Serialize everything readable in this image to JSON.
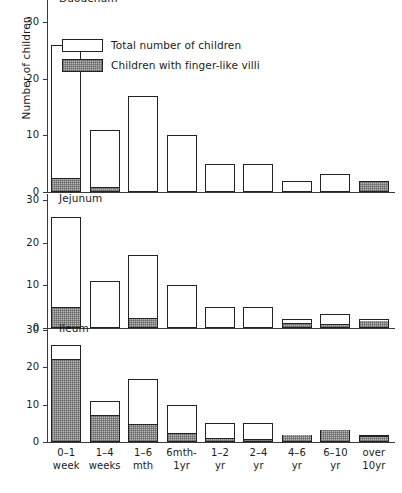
{
  "chart_data": {
    "type": "bar",
    "title": "",
    "ylabel": "Number of children",
    "xlabel": "",
    "ylim": [
      0,
      30
    ],
    "grid": false,
    "legend_position": "top-left-inside-panel-1",
    "legend": [
      {
        "key": "total",
        "label": "Total number of children",
        "style": "outline"
      },
      {
        "key": "finger_like",
        "label": "Children with finger-like villi",
        "style": "shaded"
      }
    ],
    "categories": [
      "0-1 week",
      "1-4 weeks",
      "1-6 mth",
      "6mth-1yr",
      "1-2 yr",
      "2-4 yr",
      "4-6 yr",
      "6-10 yr",
      "over 10yr"
    ],
    "category_lines": [
      [
        "0–1",
        "week"
      ],
      [
        "1–4",
        "weeks"
      ],
      [
        "1–6",
        "mth"
      ],
      [
        "6mth-",
        "1yr"
      ],
      [
        "1–2",
        "yr"
      ],
      [
        "2–4",
        "yr"
      ],
      [
        "4–6",
        "yr"
      ],
      [
        "6–10",
        "yr"
      ],
      [
        "over",
        "10yr"
      ]
    ],
    "y_ticks": [
      0,
      10,
      20,
      30
    ],
    "panels": [
      {
        "name": "Duodenum",
        "title": "Duodenum",
        "total": [
          26,
          11,
          17,
          10,
          5,
          5,
          2,
          3.2,
          2
        ],
        "finger_like": [
          2.5,
          1,
          0,
          0,
          0,
          0,
          0,
          0,
          1.8
        ]
      },
      {
        "name": "Jejunum",
        "title": "Jejunum",
        "total": [
          26,
          11,
          17,
          10,
          5,
          5,
          2,
          3.2,
          2
        ],
        "finger_like": [
          5,
          0,
          2.5,
          0,
          0,
          0,
          1.2,
          1,
          1.8
        ]
      },
      {
        "name": "Ileum",
        "title": "Ileum",
        "total": [
          26,
          11,
          17,
          10,
          5,
          5,
          2,
          3.2,
          2
        ],
        "finger_like": [
          22.3,
          7.4,
          5,
          2.4,
          1.1,
          1,
          2,
          3.2,
          1.6
        ]
      }
    ],
    "colors": {
      "outline": "#222222",
      "shaded_fill": "#b8b8b8",
      "background": "#ffffff",
      "axis": "#3a3a3a"
    }
  }
}
